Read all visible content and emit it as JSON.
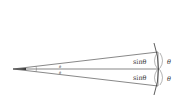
{
  "diagram": {
    "labels": {
      "sin_upper": "sinθ",
      "sin_lower": "sinθ",
      "theta_arc_upper": "θ",
      "theta_arc_lower": "θ",
      "theta_apex_upper": "θ",
      "theta_apex_lower": "θ"
    },
    "colors": {
      "line": "#444444",
      "background": "#ffffff"
    }
  }
}
